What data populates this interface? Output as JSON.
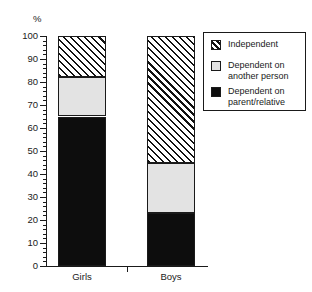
{
  "chart_data": {
    "type": "bar",
    "subtype": "stacked-100",
    "title": "",
    "xlabel": "",
    "ylabel": "%",
    "ylim": [
      0,
      100
    ],
    "grid": false,
    "legend_position": "right-top",
    "categories": [
      "Girls",
      "Boys"
    ],
    "y_tick_labels": [
      "0",
      "10",
      "20",
      "30",
      "40",
      "50",
      "60",
      "70",
      "80",
      "90",
      "100"
    ],
    "y_tick_values": [
      0,
      10,
      20,
      30,
      40,
      50,
      60,
      70,
      80,
      90,
      100
    ],
    "y_minor_tick_step": 2,
    "series": [
      {
        "name": "Dependent on parent/relative",
        "pattern": "solid-black",
        "color": "#0d0d0d",
        "values": [
          65,
          23
        ]
      },
      {
        "name": "Dependent on another person",
        "pattern": "solid-light-gray",
        "color": "#e3e3e3",
        "values": [
          17,
          22
        ]
      },
      {
        "name": "Independent",
        "pattern": "diagonal-hatch",
        "color": "#ffffff",
        "values": [
          18,
          55
        ]
      }
    ],
    "segment_boundaries": {
      "Girls": {
        "black_top": 65,
        "gray_top": 82,
        "hatch_top": 100
      },
      "Boys": {
        "black_top": 23,
        "gray_top": 45,
        "hatch_top": 100
      }
    },
    "annotations": []
  },
  "axis": {
    "y_label": "%",
    "ticks": [
      {
        "value": 100,
        "label": "100"
      },
      {
        "value": 90,
        "label": "90"
      },
      {
        "value": 80,
        "label": "80"
      },
      {
        "value": 70,
        "label": "70"
      },
      {
        "value": 60,
        "label": "60"
      },
      {
        "value": 50,
        "label": "50"
      },
      {
        "value": 40,
        "label": "40"
      },
      {
        "value": 30,
        "label": "30"
      },
      {
        "value": 20,
        "label": "20"
      },
      {
        "value": 10,
        "label": "10"
      },
      {
        "value": 0,
        "label": "0"
      }
    ]
  },
  "bars": [
    {
      "label": "Girls"
    },
    {
      "label": "Boys"
    }
  ],
  "legend": {
    "entries": [
      {
        "label": "Independent",
        "swatch": "diagonal-hatch-swatch"
      },
      {
        "label": "Dependent on\nanother person",
        "swatch": "light-gray-swatch"
      },
      {
        "label": "Dependent on\nparent/relative",
        "swatch": "black-swatch"
      }
    ]
  }
}
